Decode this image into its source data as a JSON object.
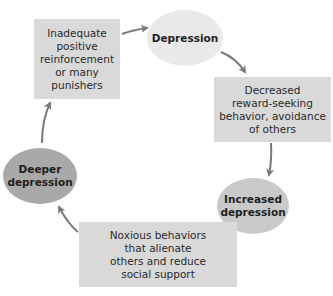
{
  "diagram": {
    "type": "cycle",
    "colors": {
      "box_fill": "#d9d9d9",
      "ellipse_light": "#e9e9e9",
      "ellipse_mid": "#c9c9c9",
      "ellipse_dark": "#a9a9a9",
      "arrow": "#7a7a7a",
      "text": "#222222"
    },
    "nodes": [
      {
        "id": "inadequate",
        "shape": "box",
        "label": "Inadequate\npositive\nreinforcement\nor many\npunishers"
      },
      {
        "id": "depression",
        "shape": "ellipse",
        "label": "Depression"
      },
      {
        "id": "decreased",
        "shape": "box",
        "label": "Decreased\nreward-seeking\nbehavior, avoidance\nof others"
      },
      {
        "id": "increased",
        "shape": "ellipse",
        "label": "Increased\ndepression"
      },
      {
        "id": "noxious",
        "shape": "box",
        "label": "Noxious behaviors\nthat alienate\nothers and reduce\nsocial support"
      },
      {
        "id": "deeper",
        "shape": "ellipse",
        "label": "Deeper\ndepression"
      }
    ],
    "edges": [
      {
        "from": "inadequate",
        "to": "depression"
      },
      {
        "from": "depression",
        "to": "decreased"
      },
      {
        "from": "decreased",
        "to": "increased"
      },
      {
        "from": "increased",
        "to": "noxious"
      },
      {
        "from": "noxious",
        "to": "deeper"
      },
      {
        "from": "deeper",
        "to": "inadequate"
      }
    ]
  }
}
